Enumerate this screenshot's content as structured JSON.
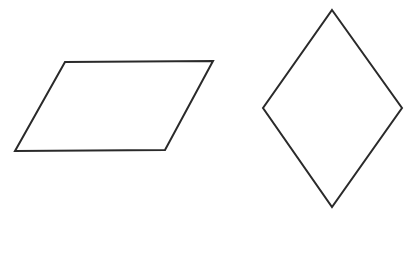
{
  "diagram": {
    "background": "#ffffff",
    "stroke_color": "#2a2a2a",
    "stroke_width": 2,
    "shapes": [
      {
        "type": "parallelogram",
        "points": "65,62 213,61 165,150 15,151"
      },
      {
        "type": "rhombus",
        "points": "332,10 402,108 332,207 263,108"
      }
    ]
  }
}
